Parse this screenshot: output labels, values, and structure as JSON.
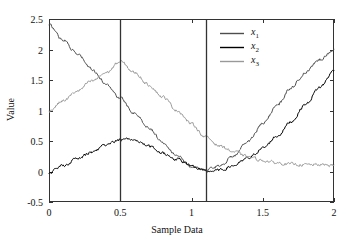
{
  "chart_data": {
    "type": "line",
    "title": "",
    "xlabel": "Sample Data",
    "ylabel": "Value",
    "xlim": [
      0,
      2
    ],
    "ylim": [
      -0.5,
      2.5
    ],
    "xticks": [
      "0",
      "0.5",
      "1",
      "1.5",
      "2"
    ],
    "xtick_values": [
      0,
      0.5,
      1,
      1.5,
      2
    ],
    "yticks": [
      "2.5",
      "2",
      "1.5",
      "1",
      "0.5",
      "0",
      "-0.5"
    ],
    "ytick_values": [
      2.5,
      2,
      1.5,
      1,
      0.5,
      0,
      -0.5
    ],
    "grid": false,
    "legend_position": "top-right",
    "legend_entries": [
      "x1",
      "x2",
      "x3"
    ],
    "annotations": {
      "vertical_lines": [
        0.5,
        1.1
      ]
    },
    "series": [
      {
        "name": "x1",
        "color": "#4d4d4d",
        "x": [
          0,
          0.1,
          0.2,
          0.3,
          0.4,
          0.5,
          0.6,
          0.7,
          0.8,
          0.9,
          1.0,
          1.1,
          1.2,
          1.3,
          1.4,
          1.5,
          1.6,
          1.7,
          1.8,
          1.9,
          2.0
        ],
        "values": [
          2.4,
          2.16,
          1.92,
          1.68,
          1.44,
          1.2,
          0.96,
          0.72,
          0.48,
          0.26,
          0.08,
          0.02,
          0.1,
          0.26,
          0.5,
          0.78,
          1.08,
          1.38,
          1.62,
          1.84,
          2.0
        ]
      },
      {
        "name": "x2",
        "color": "#000000",
        "x": [
          0,
          0.1,
          0.2,
          0.3,
          0.4,
          0.5,
          0.6,
          0.7,
          0.8,
          0.9,
          1.0,
          1.1,
          1.2,
          1.3,
          1.4,
          1.5,
          1.6,
          1.7,
          1.8,
          1.9,
          2.0
        ],
        "values": [
          -0.02,
          0.1,
          0.21,
          0.32,
          0.43,
          0.52,
          0.52,
          0.42,
          0.3,
          0.2,
          0.1,
          0.0,
          0.02,
          0.1,
          0.22,
          0.38,
          0.58,
          0.82,
          1.1,
          1.38,
          1.65
        ]
      },
      {
        "name": "x3",
        "color": "#999999",
        "x": [
          0,
          0.1,
          0.2,
          0.3,
          0.4,
          0.5,
          0.6,
          0.7,
          0.8,
          0.9,
          1.0,
          1.1,
          1.2,
          1.3,
          1.4,
          1.5,
          1.6,
          1.7,
          1.8,
          1.9,
          2.0
        ],
        "values": [
          1.0,
          1.16,
          1.32,
          1.48,
          1.62,
          1.8,
          1.62,
          1.42,
          1.22,
          1.0,
          0.78,
          0.56,
          0.42,
          0.32,
          0.24,
          0.18,
          0.14,
          0.12,
          0.11,
          0.11,
          0.1
        ]
      }
    ]
  },
  "legend": {
    "items": [
      {
        "label": "x",
        "sub": "1",
        "color": "#4d4d4d"
      },
      {
        "label": "x",
        "sub": "2",
        "color": "#000000"
      },
      {
        "label": "x",
        "sub": "3",
        "color": "#999999"
      }
    ]
  },
  "axes": {
    "box_color": "#333333",
    "vline_color": "#333333"
  }
}
